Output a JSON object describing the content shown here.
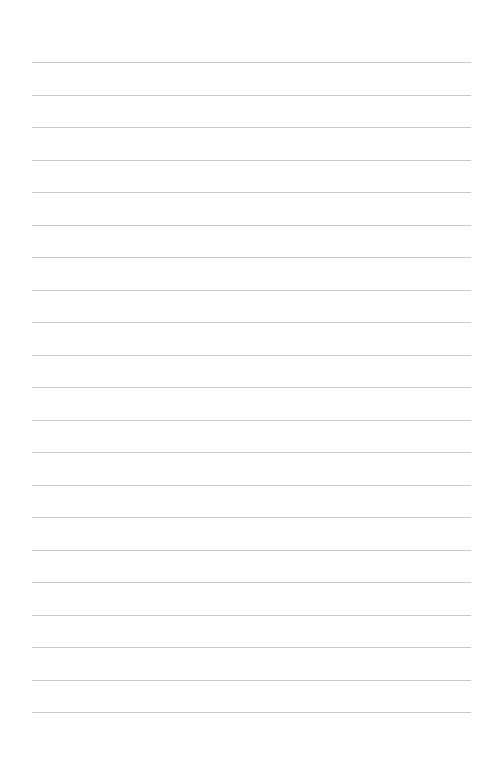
{
  "page": {
    "type": "lined-paper",
    "background_color": "#ffffff",
    "line_color": "#c9c9c9",
    "line_count": 21,
    "line_left": 32,
    "line_right": 471,
    "first_line_y": 62,
    "line_spacing": 32.5,
    "text_content": ""
  }
}
